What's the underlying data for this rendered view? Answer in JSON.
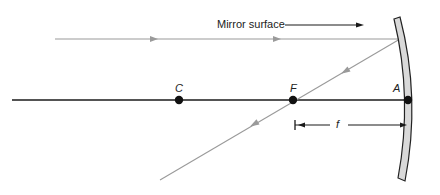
{
  "diagram": {
    "type": "concave-mirror-ray-diagram",
    "colors": {
      "axis": "#1a1a1a",
      "ray": "#9a9a9a",
      "mirror_fill": "#d9d9d9",
      "mirror_stroke": "#222222"
    },
    "labels": {
      "mirror_surface": "Mirror surface",
      "center_of_curvature": "C",
      "focal_point": "F",
      "vertex": "A",
      "focal_length": "f"
    },
    "points": [
      {
        "name": "C",
        "x": 179,
        "y": 100
      },
      {
        "name": "F",
        "x": 293,
        "y": 100
      },
      {
        "name": "A",
        "x": 408,
        "y": 100
      }
    ]
  }
}
